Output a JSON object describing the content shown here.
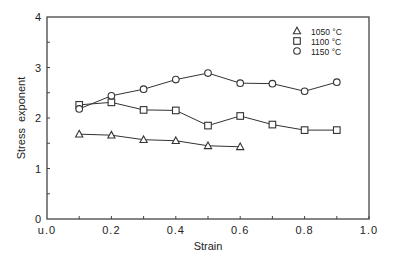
{
  "chart_data": {
    "type": "line",
    "title": "",
    "xlabel": "Strain",
    "ylabel": "Stress  exponent",
    "xlim": [
      0,
      1.0
    ],
    "ylim": [
      0,
      4
    ],
    "xticks": [
      0.0,
      0.2,
      0.4,
      0.6,
      0.8,
      1.0
    ],
    "xtick_labels": [
      "u.0",
      "0.2",
      "0.4",
      "0.6",
      "0.8",
      "1.0"
    ],
    "yticks": [
      0,
      1,
      2,
      3,
      4
    ],
    "ytick_labels": [
      "0",
      "1",
      "2",
      "3",
      "4"
    ],
    "grid": false,
    "legend_position": "upper right",
    "series": [
      {
        "name": "1050 °C",
        "marker": "triangle",
        "x": [
          0.1,
          0.2,
          0.3,
          0.4,
          0.5,
          0.6
        ],
        "values": [
          1.68,
          1.66,
          1.57,
          1.55,
          1.45,
          1.43
        ]
      },
      {
        "name": "1100 °C",
        "marker": "square",
        "x": [
          0.1,
          0.2,
          0.3,
          0.4,
          0.5,
          0.6,
          0.7,
          0.8,
          0.9
        ],
        "values": [
          2.26,
          2.31,
          2.16,
          2.15,
          1.85,
          2.04,
          1.87,
          1.76,
          1.76
        ]
      },
      {
        "name": "1150 °C",
        "marker": "circle",
        "x": [
          0.1,
          0.2,
          0.3,
          0.4,
          0.5,
          0.6,
          0.7,
          0.8,
          0.9
        ],
        "values": [
          2.18,
          2.44,
          2.57,
          2.76,
          2.89,
          2.69,
          2.68,
          2.53,
          2.71
        ]
      }
    ]
  },
  "colors": {
    "axis": "#444444",
    "series": "#333333",
    "background": "#ffffff"
  }
}
